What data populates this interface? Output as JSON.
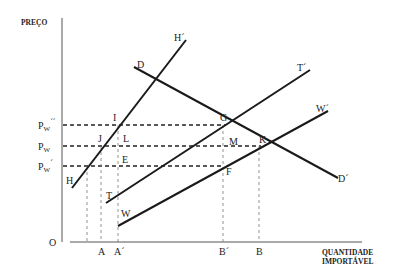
{
  "diagram": {
    "y_axis_label": "PREÇO",
    "x_axis_label_line1": "QUANTIDADE",
    "x_axis_label_line2": "IMPORTÁVEL",
    "origin_label": "O",
    "price_levels": [
      {
        "label_main": "P",
        "label_sub": "W",
        "label_prime": "´´",
        "name": "Pw''"
      },
      {
        "label_main": "P",
        "label_sub": "W",
        "label_prime": "",
        "name": "Pw"
      },
      {
        "label_main": "P",
        "label_sub": "W",
        "label_prime": "´",
        "name": "Pw'"
      }
    ],
    "curves": {
      "H": {
        "start_label": "H",
        "end_label": "H´"
      },
      "D": {
        "start_label": "D",
        "end_label": "D´"
      },
      "T": {
        "start_label": "T",
        "end_label": "T´"
      },
      "W": {
        "start_label": "W",
        "end_label": "W´"
      }
    },
    "points": {
      "I": "I",
      "J": "J",
      "L": "L",
      "E": "E",
      "G": "G",
      "M": "M",
      "K": "K",
      "F": "F"
    },
    "quantity_labels": {
      "A": "A",
      "A_prime": "A´",
      "B_prime": "B´",
      "B": "B"
    }
  }
}
